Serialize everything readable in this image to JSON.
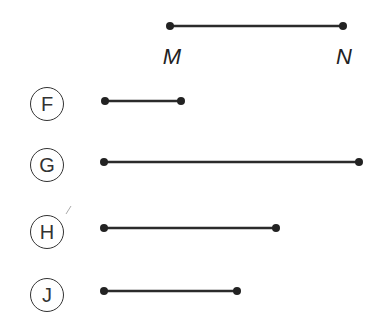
{
  "reference_segment": {
    "start_label": "M",
    "end_label": "N",
    "x1": 170,
    "x2": 343,
    "y": 26
  },
  "options": [
    {
      "letter": "F",
      "x1": 105,
      "x2": 181,
      "y": 101
    },
    {
      "letter": "G",
      "x1": 104,
      "x2": 359,
      "y": 162
    },
    {
      "letter": "H",
      "x1": 104,
      "x2": 276,
      "y": 228
    },
    {
      "letter": "J",
      "x1": 104,
      "x2": 237,
      "y": 291
    }
  ],
  "colors": {
    "line": "#2b2b2b",
    "text": "#222222"
  }
}
